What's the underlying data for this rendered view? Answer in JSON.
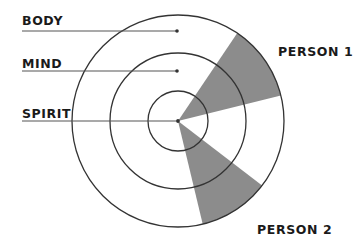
{
  "diagram": {
    "type": "concentric-rings-wedge",
    "center": {
      "x": 178,
      "y": 121
    },
    "rings": [
      {
        "name": "SPIRIT",
        "radius": 30,
        "label_y": 119,
        "line_y": 121
      },
      {
        "name": "MIND",
        "radius": 68,
        "label_y": 69,
        "line_y": 71
      },
      {
        "name": "BODY",
        "radius": 106,
        "label_y": 25,
        "line_y": 31
      }
    ],
    "ring_labels": {
      "body": "BODY",
      "mind": "MIND",
      "spirit": "SPIRIT"
    },
    "wedges": [
      {
        "name": "PERSON 1",
        "start_angle_deg": -56,
        "end_angle_deg": -14,
        "fill": "#8c8c8c"
      },
      {
        "name": "PERSON 2",
        "start_angle_deg": 37.5,
        "end_angle_deg": 76.5,
        "fill": "#8c8c8c"
      }
    ],
    "wedge_labels": {
      "person1": "PERSON 1",
      "person2": "PERSON 2"
    },
    "colors": {
      "line": "#333333",
      "wedge": "#8c8c8c",
      "text": "#1a1a1a",
      "background": "#ffffff"
    }
  }
}
